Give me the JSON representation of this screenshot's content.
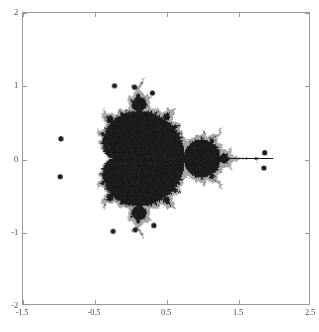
{
  "figure": {
    "title": "",
    "background_color": "#ffffff",
    "frame_color": "#9a9a9a"
  },
  "chart_data": {
    "type": "scatter",
    "title": "",
    "subtitle": "",
    "xlabel": "",
    "ylabel": "",
    "xlim": [
      -1.5,
      2.5
    ],
    "ylim": [
      -2,
      2
    ],
    "xticks": [
      -1.5,
      -0.5,
      0.5,
      1.5,
      2.5
    ],
    "xticklabels": [
      "-1.5",
      "-0.5",
      "0.5",
      "1.5",
      "2.5"
    ],
    "yticks": [
      -2,
      -1,
      0,
      1,
      2
    ],
    "yticklabels": [
      "-2",
      "-1",
      "0",
      "1",
      "2"
    ],
    "grid": false,
    "legend": null,
    "legend_position": "none",
    "colors": {
      "region_light": "#a8a8a8",
      "region_dark": "#1c1c1c",
      "background": "#ffffff"
    },
    "regions": [
      {
        "name": "main-disk",
        "color": "#a8a8a8",
        "center": [
          -0.15,
          0.0
        ],
        "radius_x": 1.02,
        "radius_y": 1.0
      },
      {
        "name": "period-2-bulb",
        "color": "#1c1c1c",
        "center": [
          1.03,
          -0.03
        ],
        "radius_x": 0.44,
        "radius_y": 0.58
      },
      {
        "name": "period-4-bulb",
        "color": "#a8a8a8",
        "center": [
          1.62,
          -0.03
        ],
        "radius_x": 0.26,
        "radius_y": 0.26
      },
      {
        "name": "upper-left-bulb",
        "color": "#1c1c1c",
        "center": [
          -0.58,
          0.78
        ],
        "radius_x": 0.2,
        "radius_y": 0.2
      },
      {
        "name": "lower-left-bulb",
        "color": "#1c1c1c",
        "center": [
          -0.58,
          -0.8
        ],
        "radius_x": 0.2,
        "radius_y": 0.2
      }
    ],
    "satellite_points": [
      {
        "x": -0.22,
        "y": 1.0
      },
      {
        "x": 0.06,
        "y": 0.98
      },
      {
        "x": 0.31,
        "y": 0.9
      },
      {
        "x": -0.97,
        "y": 0.27
      },
      {
        "x": -0.98,
        "y": -0.25
      },
      {
        "x": -0.24,
        "y": -1.0
      },
      {
        "x": 0.07,
        "y": -0.98
      },
      {
        "x": 0.33,
        "y": -0.92
      },
      {
        "x": 1.88,
        "y": 0.08
      },
      {
        "x": 1.87,
        "y": -0.13
      }
    ]
  },
  "axes": {
    "x_tick_labels": [
      "-1.5",
      "-0.5",
      "0.5",
      "1.5",
      "2.5"
    ],
    "y_tick_labels": [
      "2",
      "1",
      "0",
      "-1",
      "-2"
    ]
  }
}
